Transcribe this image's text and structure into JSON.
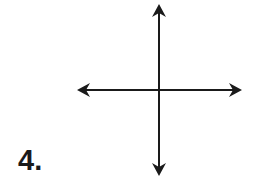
{
  "problem": {
    "number_label": "4."
  },
  "diagram": {
    "type": "coordinate-axes",
    "origin": {
      "x": 159,
      "y": 90
    },
    "x_axis": {
      "from": 77,
      "to": 241,
      "arrows": [
        "left",
        "right"
      ]
    },
    "y_axis": {
      "from": 5,
      "to": 175,
      "arrows": [
        "up",
        "down"
      ]
    },
    "stroke_color": "#1a1a1a",
    "background": "#ffffff"
  }
}
